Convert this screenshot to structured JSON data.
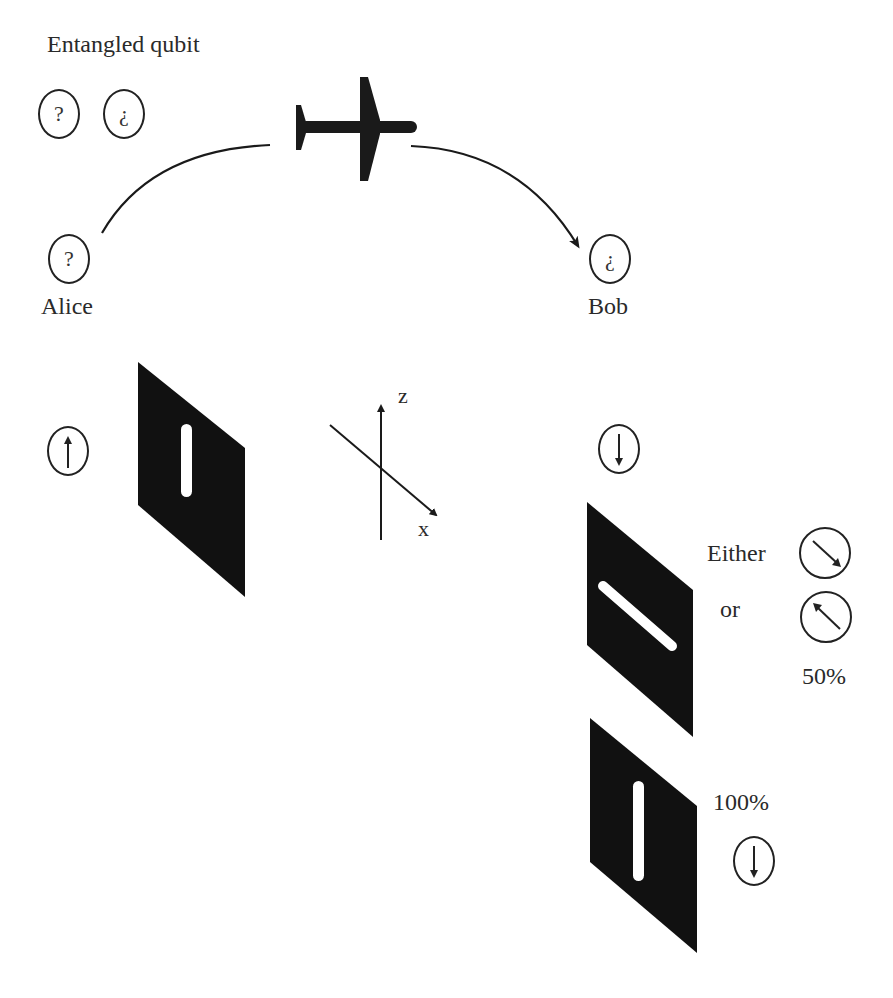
{
  "title": "Entangled qubit",
  "pair": [
    {
      "symbol": "?",
      "id": "qubit-a"
    },
    {
      "symbol": "¿",
      "id": "qubit-b"
    }
  ],
  "alice": {
    "name": "Alice",
    "symbol": "?",
    "measured_state": "up-arrow",
    "analyzer_orientation": "vertical"
  },
  "bob": {
    "name": "Bob",
    "symbol": "¿",
    "initial_state": "down-arrow",
    "first_analyzer": {
      "orientation": "diagonal",
      "either_label": "Either",
      "or_label": "or",
      "outcomes": [
        "down-right-arrow",
        "up-left-arrow"
      ],
      "probability": "50%"
    },
    "second_analyzer": {
      "orientation": "vertical",
      "probability": "100%",
      "outcome": "down-arrow"
    }
  },
  "axes": {
    "z_label": "z",
    "x_label": "x"
  },
  "transport_icon": "airplane-icon",
  "colors": {
    "ink": "#1a1a1a",
    "plate": "#111111",
    "background": "#ffffff"
  }
}
